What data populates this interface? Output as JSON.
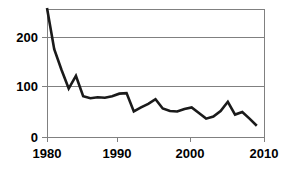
{
  "chart_data": {
    "type": "line",
    "title": "",
    "subtitle": "",
    "xlabel": "",
    "ylabel": "",
    "xlim": [
      1980,
      2010
    ],
    "ylim": [
      0,
      250
    ],
    "xticks": [
      1980,
      1990,
      2000,
      2010
    ],
    "yticks": [
      0,
      100,
      200
    ],
    "xtick_labels": [
      "1980",
      "1990",
      "2000",
      "2010"
    ],
    "ytick_labels": [
      "0",
      "100",
      "200"
    ],
    "grid": "horizontal",
    "legend": null,
    "series": [
      {
        "name": "series-1",
        "color": "#1a1a1a",
        "x": [
          1980,
          1981,
          1982,
          1983,
          1984,
          1985,
          1986,
          1987,
          1988,
          1989,
          1990,
          1991,
          1992,
          1993,
          1994,
          1995,
          1996,
          1997,
          1998,
          1999,
          2000,
          2001,
          2002,
          2003,
          2004,
          2005,
          2006,
          2007,
          2008,
          2009
        ],
        "values": [
          253,
          172,
          132,
          95,
          120,
          80,
          76,
          78,
          77,
          80,
          85,
          86,
          50,
          58,
          65,
          74,
          56,
          51,
          50,
          55,
          58,
          47,
          36,
          40,
          51,
          69,
          44,
          49,
          36,
          22
        ]
      }
    ]
  },
  "axes": {
    "y": {
      "labels": [
        "200",
        "100",
        "0"
      ]
    },
    "x": {
      "labels": [
        "1980",
        "1990",
        "2000",
        "2010"
      ]
    }
  }
}
